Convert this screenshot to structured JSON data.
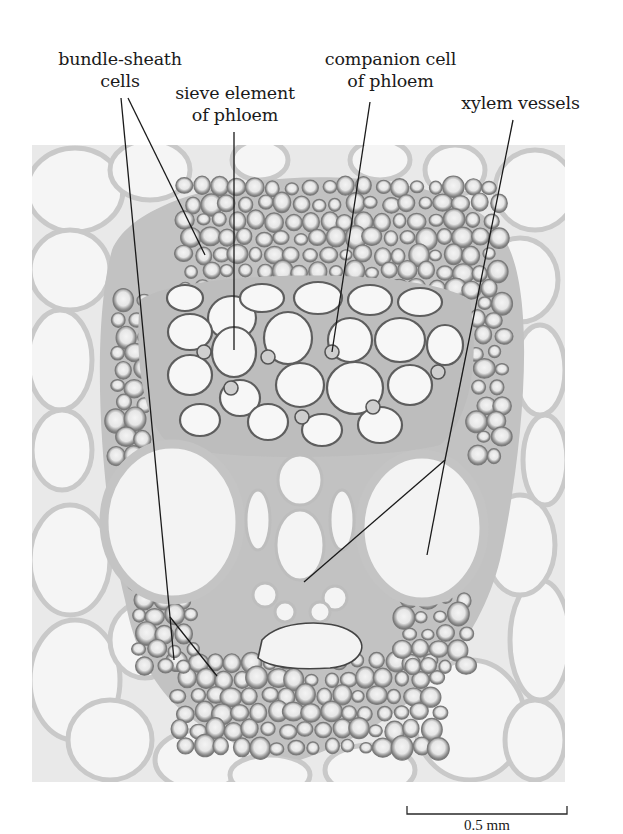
{
  "figure": {
    "type": "labeled-micrograph",
    "micrograph_bounds": {
      "x": 32,
      "y": 145,
      "width": 533,
      "height": 637
    },
    "colors": {
      "background": "#ffffff",
      "micrograph_bg": "#ededed",
      "cell_lumen": "#f6f6f6",
      "cell_wall_light": "#c6c6c6",
      "cell_wall_dark": "#6b6b6b",
      "leader_line": "#1a1a1a",
      "text": "#1a1a1a"
    }
  },
  "labels": [
    {
      "id": "bundle-sheath-cells",
      "lines": [
        "bundle-sheath",
        "cells"
      ],
      "leaders": [
        {
          "from": [
            121,
            98
          ],
          "to": [
            170,
            617
          ],
          "branches": [
            [
              174,
              660
            ],
            [
              217,
              676
            ]
          ]
        },
        {
          "from": [
            128,
            98
          ],
          "to": [
            205,
            255
          ]
        }
      ]
    },
    {
      "id": "sieve-element-of-phloem",
      "lines": [
        "sieve element",
        "of phloem"
      ],
      "leaders": [
        {
          "from": [
            234,
            132
          ],
          "to": [
            234,
            350
          ]
        }
      ]
    },
    {
      "id": "companion-cell-of-phloem",
      "lines": [
        "companion cell",
        "of phloem"
      ],
      "leaders": [
        {
          "from": [
            370,
            102
          ],
          "to": [
            332,
            352
          ]
        }
      ]
    },
    {
      "id": "xylem-vessels",
      "lines": [
        "xylem vessels"
      ],
      "leaders": [
        {
          "from": [
            513,
            120
          ],
          "to": [
            445,
            460
          ],
          "branches": [
            [
              427,
              555
            ],
            [
              304,
              582
            ]
          ]
        }
      ]
    }
  ],
  "scale_bar": {
    "label": "0.5 mm",
    "x1": 407,
    "x2": 567,
    "y": 814
  }
}
